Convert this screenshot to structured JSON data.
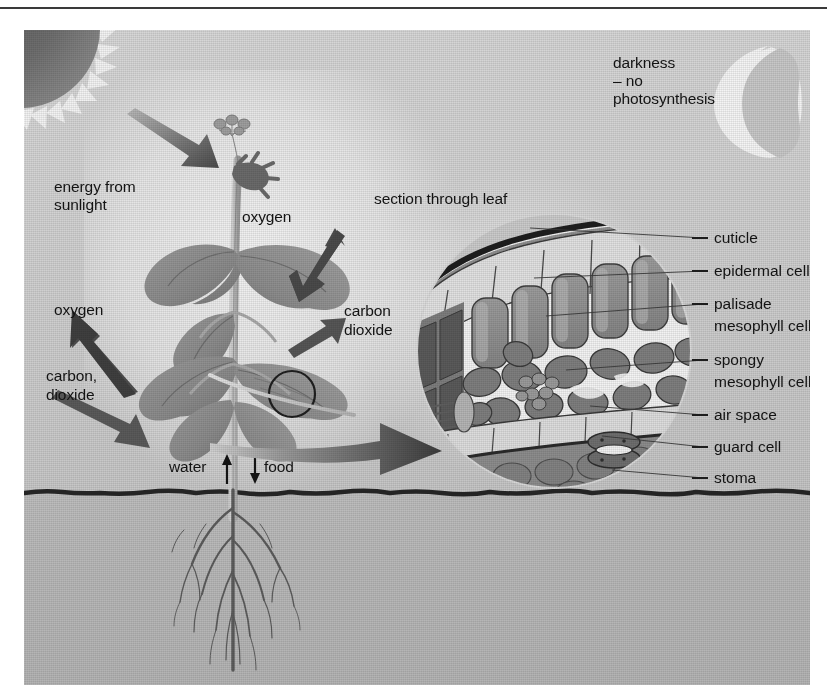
{
  "figure": {
    "background_color": "#c9c9c9",
    "ink_color": "#141414"
  },
  "sun": {
    "icon": "sun-icon",
    "label": "energy from\nsunlight",
    "label_line1": "energy from",
    "label_line2": "sunlight"
  },
  "moon": {
    "icon": "crescent-moon-icon",
    "label_line1": "darkness",
    "label_line2": "– no",
    "label_line3": "photosynthesis"
  },
  "plant": {
    "gas_labels": [
      {
        "id": "oxygen-top",
        "text": "oxygen",
        "x": 218,
        "y": 178
      },
      {
        "id": "carbon-dioxide-right-l1",
        "text": "carbon",
        "x": 320,
        "y": 278
      },
      {
        "id": "carbon-dioxide-right-l2",
        "text": "dioxide",
        "x": 320,
        "y": 296
      },
      {
        "id": "oxygen-left",
        "text": "oxygen",
        "x": 30,
        "y": 273
      },
      {
        "id": "carbon-dioxide-left-l1",
        "text": "carbon,",
        "x": 22,
        "y": 338
      },
      {
        "id": "carbon-dioxide-left-l2",
        "text": "dioxide",
        "x": 22,
        "y": 357
      }
    ],
    "transport": {
      "water_label": "water",
      "water_arrow": "↑",
      "food_label": "food",
      "food_arrow": "↓"
    }
  },
  "inset": {
    "title": "section through leaf",
    "callout_arrow": "magnify-arrow-icon",
    "labels": [
      {
        "id": "cuticle",
        "text": "cuticle",
        "y": 201
      },
      {
        "id": "epidermal-cell",
        "text": "epidermal cell",
        "y": 234
      },
      {
        "id": "palisade",
        "text": "palisade",
        "y": 267
      },
      {
        "id": "palisade-2",
        "text": "mesophyll cell",
        "y": 289
      },
      {
        "id": "spongy",
        "text": "spongy",
        "y": 323
      },
      {
        "id": "spongy-2",
        "text": "mesophyll cell",
        "y": 345
      },
      {
        "id": "air-space",
        "text": "air space",
        "y": 378
      },
      {
        "id": "guard-cell",
        "text": "guard cell",
        "y": 410
      },
      {
        "id": "stoma",
        "text": "stoma",
        "y": 441
      }
    ]
  }
}
